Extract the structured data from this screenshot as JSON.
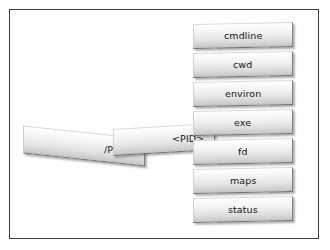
{
  "diagram": {
    "frame": {
      "border_color": "#3b3b3b",
      "background_color": "#ffffff"
    },
    "chain": [
      {
        "id": "proc",
        "label": "/PROC"
      },
      {
        "id": "pid",
        "label": "<PID>"
      }
    ],
    "attributes": [
      {
        "id": "cmdline",
        "label": "cmdline",
        "top": 13
      },
      {
        "id": "cwd",
        "label": "cwd",
        "top": 42
      },
      {
        "id": "environ",
        "label": "environ",
        "top": 71
      },
      {
        "id": "exe",
        "label": "exe",
        "top": 100
      },
      {
        "id": "fd",
        "label": "fd",
        "top": 129
      },
      {
        "id": "maps",
        "label": "maps",
        "top": 158
      },
      {
        "id": "status",
        "label": "status",
        "top": 187
      }
    ],
    "style": {
      "slab_fill_top": "#ffffff",
      "slab_fill_bottom": "#c2c2c2",
      "slab_border": "#8d8d8d",
      "text_color": "#141414",
      "shadow_color": "rgba(70,70,70,0.40)"
    }
  }
}
